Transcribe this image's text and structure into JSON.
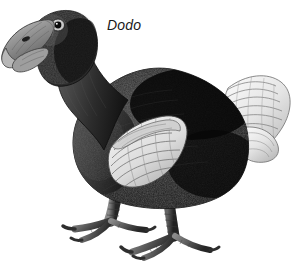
{
  "figure": {
    "subject": "Dodo",
    "caption": "Dodo",
    "style": "black-and-white engraving illustration",
    "background_color": "#ffffff",
    "width": 299,
    "height": 265
  },
  "palette": {
    "background": "#ffffff",
    "body_dark": "#171717",
    "body_mid": "#3a3a3a",
    "breast_grey": "#4a4a4a",
    "beak_grey": "#8d8d8d",
    "beak_light": "#c8c8c8",
    "wing_light": "#e6e6e6",
    "tail_white": "#f2f2f2",
    "leg_grey": "#6b6b6b",
    "outline": "#0d0d0d",
    "caption_color": "#1a1a1a"
  },
  "anatomy": {
    "parts": [
      {
        "id": "beak",
        "label": "hooked grey beak",
        "color": "#8d8d8d"
      },
      {
        "id": "eye",
        "label": "eye",
        "color": "#111111"
      },
      {
        "id": "head",
        "label": "head",
        "color": "#2a2a2a"
      },
      {
        "id": "neck",
        "label": "neck",
        "color": "#2e2e2e"
      },
      {
        "id": "breast",
        "label": "breast",
        "color": "#4a4a4a"
      },
      {
        "id": "body",
        "label": "body plumage",
        "color": "#171717"
      },
      {
        "id": "wing",
        "label": "pale wing patch",
        "color": "#e6e6e6"
      },
      {
        "id": "tail",
        "label": "white curly tail plume",
        "color": "#f2f2f2"
      },
      {
        "id": "legs",
        "label": "scaly legs",
        "color": "#6b6b6b"
      },
      {
        "id": "feet",
        "label": "clawed toes",
        "color": "#5a5a5a"
      }
    ]
  }
}
